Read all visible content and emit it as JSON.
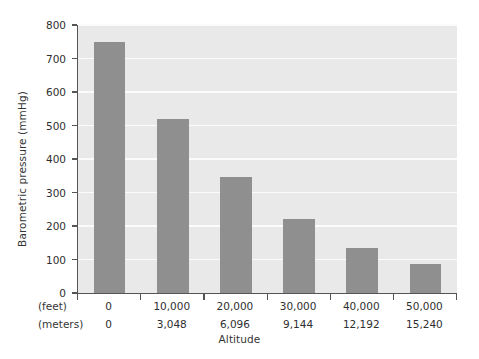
{
  "chart_data": {
    "type": "bar",
    "title": "",
    "xlabel": "Altitude",
    "ylabel": "Barometric pressure (mmHg)",
    "categories": [
      "0",
      "10,000",
      "20,000",
      "30,000",
      "40,000",
      "50,000"
    ],
    "categories_meters": [
      "0",
      "3,048",
      "6,096",
      "9,144",
      "12,192",
      "15,240"
    ],
    "feet_row_label": "(feet)",
    "meters_row_label": "(meters)",
    "values": [
      750,
      520,
      345,
      220,
      135,
      87
    ],
    "ylim": [
      0,
      800
    ],
    "yticks": [
      0,
      100,
      200,
      300,
      400,
      500,
      600,
      700,
      800
    ],
    "ytick_labels": [
      "0",
      "100",
      "200",
      "300",
      "400",
      "500",
      "600",
      "700",
      "800"
    ],
    "grid": true,
    "grid_axis": "y",
    "legend": null,
    "bar_color": "#8f8f8f",
    "plot_background": "#e9e9e9",
    "gridline_color": "#fbfbfb",
    "axis_color": "#555555",
    "figure_background": "#ffffff"
  }
}
